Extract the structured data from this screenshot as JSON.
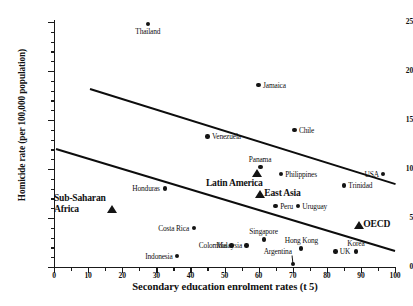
{
  "chart_data": {
    "type": "scatter",
    "title": "",
    "xlabel": "Secondary education enrolment rates (t  5)",
    "ylabel": "Homicide rate (per 100,000 population)",
    "xlim": [
      0,
      100
    ],
    "ylim": [
      0,
      25
    ],
    "grid": false,
    "legend": "none",
    "x_ticks_major": [
      0,
      10,
      20,
      30,
      40,
      50,
      60,
      70,
      80,
      90,
      100
    ],
    "x_ticks_minor": [
      5,
      15,
      25,
      35,
      45,
      55,
      65,
      75,
      85,
      95
    ],
    "y_ticks_major": [
      0,
      5,
      10,
      15,
      20,
      25
    ],
    "y_ticks_minor": [
      1,
      2,
      3,
      4,
      6,
      7,
      8,
      9,
      11,
      12,
      13,
      14,
      16,
      17,
      18,
      19,
      21,
      22,
      23,
      24
    ],
    "points": [
      {
        "label": "Thailand",
        "x": 27.5,
        "y": 24.8,
        "marker": "circle",
        "label_pos": "below"
      },
      {
        "label": "Jamaica",
        "x": 60.0,
        "y": 18.6,
        "marker": "circle",
        "label_pos": "right"
      },
      {
        "label": "Venezuela",
        "x": 45.0,
        "y": 13.3,
        "marker": "circle",
        "label_pos": "right"
      },
      {
        "label": "Chile",
        "x": 70.5,
        "y": 14.0,
        "marker": "circle",
        "label_pos": "right"
      },
      {
        "label": "Panama",
        "x": 60.5,
        "y": 10.2,
        "marker": "circle",
        "label_pos": "above"
      },
      {
        "label": "Philippines",
        "x": 66.5,
        "y": 9.5,
        "marker": "circle",
        "label_pos": "right"
      },
      {
        "label": "USA",
        "x": 96.5,
        "y": 9.5,
        "marker": "circle",
        "label_pos": "left"
      },
      {
        "label": "Trinidad",
        "x": 85.0,
        "y": 8.3,
        "marker": "circle",
        "label_pos": "right"
      },
      {
        "label": "Honduras",
        "x": 32.5,
        "y": 8.0,
        "marker": "circle",
        "label_pos": "left"
      },
      {
        "label": "Peru",
        "x": 65.0,
        "y": 6.2,
        "marker": "circle",
        "label_pos": "right"
      },
      {
        "label": "Uruguay",
        "x": 71.5,
        "y": 6.2,
        "marker": "circle",
        "label_pos": "right"
      },
      {
        "label": "Costa Rica",
        "x": 41.0,
        "y": 4.0,
        "marker": "circle",
        "label_pos": "left"
      },
      {
        "label": "Singapore",
        "x": 61.5,
        "y": 2.8,
        "marker": "circle",
        "label_pos": "above"
      },
      {
        "label": "Malaysia",
        "x": 56.5,
        "y": 2.2,
        "marker": "circle",
        "label_pos": "left"
      },
      {
        "label": "Colombia",
        "x": 52.0,
        "y": 2.2,
        "marker": "circle",
        "label_pos": "left"
      },
      {
        "label": "Hong Kong",
        "x": 72.5,
        "y": 1.9,
        "marker": "circle",
        "label_pos": "above"
      },
      {
        "label": "UK",
        "x": 82.5,
        "y": 1.6,
        "marker": "circle",
        "label_pos": "right"
      },
      {
        "label": "Korea",
        "x": 88.5,
        "y": 1.6,
        "marker": "circle",
        "label_pos": "above"
      },
      {
        "label": "Indonesia",
        "x": 36.0,
        "y": 1.1,
        "marker": "circle",
        "label_pos": "left"
      },
      {
        "label": "Argentina",
        "x": 70.0,
        "y": 0.3,
        "marker": "circle",
        "label_pos": "leader"
      }
    ],
    "group_markers": [
      {
        "label": "Sub-Saharan\nAfrica",
        "x": 17.0,
        "y": 5.6,
        "marker": "triangle",
        "label_pos": "left"
      },
      {
        "label": "Latin America",
        "x": 59.5,
        "y": 9.2,
        "marker": "triangle",
        "label_pos": "below-left"
      },
      {
        "label": "East Asia",
        "x": 60.5,
        "y": 7.1,
        "marker": "triangle",
        "label_pos": "right"
      },
      {
        "label": "OECD",
        "x": 89.5,
        "y": 3.9,
        "marker": "triangle",
        "label_pos": "right"
      }
    ],
    "trend_lines": [
      {
        "name": "upper-regression-line",
        "x1": 10.5,
        "y1": 18.3,
        "x2": 100.0,
        "y2": 8.6
      },
      {
        "name": "lower-regression-line",
        "x1": 0.6,
        "y1": 12.1,
        "x2": 100.0,
        "y2": 1.7
      }
    ]
  }
}
